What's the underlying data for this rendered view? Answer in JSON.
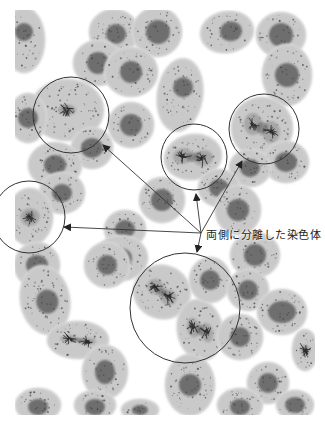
{
  "figure": {
    "width": 325,
    "height": 425,
    "background": "#ffffff",
    "image_area": {
      "x": 15,
      "y": 10,
      "width": 300,
      "height": 405
    },
    "colors": {
      "cytoplasm": "#c9c9c9",
      "cytoplasm_edge": "#d9d9d9",
      "nucleus": "#6e6e6e",
      "chromosome": "#2a2a2a",
      "speckle": "#4a4a4a",
      "annotation": "#333333"
    }
  },
  "annotation": {
    "label": "両側に分離した染色体",
    "label_position": {
      "x": 206,
      "y": 226
    },
    "arrow_origin": {
      "x": 201,
      "y": 233
    },
    "arrows": [
      {
        "to_x": 103,
        "to_y": 145
      },
      {
        "to_x": 196,
        "to_y": 194
      },
      {
        "to_x": 242,
        "to_y": 161
      },
      {
        "to_x": 64,
        "to_y": 227
      },
      {
        "to_x": 197,
        "to_y": 252
      }
    ],
    "circles": [
      {
        "cx": 71,
        "cy": 115,
        "r": 38
      },
      {
        "cx": 194,
        "cy": 157,
        "r": 33
      },
      {
        "cx": 264,
        "cy": 129,
        "r": 35
      },
      {
        "cx": 29,
        "cy": 217,
        "r": 36
      },
      {
        "cx": 185,
        "cy": 308,
        "r": 55
      }
    ]
  },
  "cells": [
    {
      "cx": 24,
      "cy": 40,
      "rx": 20,
      "ry": 32,
      "rot": 0,
      "nuc": {
        "dx": 0,
        "dy": -8,
        "rx": 9,
        "ry": 9
      },
      "phase": "interphase"
    },
    {
      "cx": 114,
      "cy": 32,
      "rx": 24,
      "ry": 22,
      "rot": 0,
      "nuc": {
        "dx": 2,
        "dy": 2,
        "rx": 10,
        "ry": 10
      },
      "phase": "interphase"
    },
    {
      "cx": 157,
      "cy": 32,
      "rx": 24,
      "ry": 24,
      "rot": 0,
      "nuc": {
        "dx": 1,
        "dy": 0,
        "rx": 12,
        "ry": 12
      },
      "phase": "interphase"
    },
    {
      "cx": 227,
      "cy": 32,
      "rx": 26,
      "ry": 20,
      "rot": -10,
      "nuc": {
        "dx": 4,
        "dy": 0,
        "rx": 11,
        "ry": 10
      },
      "phase": "interphase"
    },
    {
      "cx": 281,
      "cy": 35,
      "rx": 24,
      "ry": 22,
      "rot": 0,
      "nuc": {
        "dx": 0,
        "dy": 0,
        "rx": 12,
        "ry": 12
      },
      "phase": "interphase"
    },
    {
      "cx": 98,
      "cy": 63,
      "rx": 24,
      "ry": 22,
      "rot": 0,
      "nuc": {
        "dx": 0,
        "dy": 0,
        "rx": 11,
        "ry": 11
      },
      "phase": "interphase"
    },
    {
      "cx": 131,
      "cy": 72,
      "rx": 26,
      "ry": 24,
      "rot": 0,
      "nuc": {
        "dx": 0,
        "dy": 0,
        "rx": 11,
        "ry": 11
      },
      "phase": "interphase"
    },
    {
      "cx": 180,
      "cy": 95,
      "rx": 22,
      "ry": 36,
      "rot": 8,
      "nuc": {
        "dx": 2,
        "dy": -8,
        "rx": 10,
        "ry": 10
      },
      "phase": "interphase"
    },
    {
      "cx": 287,
      "cy": 75,
      "rx": 24,
      "ry": 30,
      "rot": 0,
      "nuc": {
        "dx": 0,
        "dy": 0,
        "rx": 12,
        "ry": 12
      },
      "phase": "interphase"
    },
    {
      "cx": 67,
      "cy": 110,
      "rx": 36,
      "ry": 30,
      "rot": 0,
      "nuc": {
        "dx": -2,
        "dy": 3,
        "rx": 13,
        "ry": 10
      },
      "phase": "metaphase"
    },
    {
      "cx": 28,
      "cy": 118,
      "rx": 18,
      "ry": 24,
      "rot": 0,
      "nuc": {
        "dx": 0,
        "dy": 0,
        "rx": 10,
        "ry": 10
      },
      "phase": "interphase"
    },
    {
      "cx": 131,
      "cy": 125,
      "rx": 22,
      "ry": 22,
      "rot": 0,
      "nuc": {
        "dx": 0,
        "dy": 0,
        "rx": 11,
        "ry": 11
      },
      "phase": "interphase"
    },
    {
      "cx": 92,
      "cy": 148,
      "rx": 20,
      "ry": 20,
      "rot": 0,
      "nuc": {
        "dx": 0,
        "dy": 0,
        "rx": 11,
        "ry": 10
      },
      "phase": "interphase"
    },
    {
      "cx": 193,
      "cy": 157,
      "rx": 28,
      "ry": 22,
      "rot": -10,
      "nuc": {
        "dx": 0,
        "dy": 0,
        "rx": 22,
        "ry": 14
      },
      "phase": "anaphase"
    },
    {
      "cx": 262,
      "cy": 128,
      "rx": 30,
      "ry": 30,
      "rot": 0,
      "nuc": {
        "dx": 0,
        "dy": 0,
        "rx": 20,
        "ry": 20
      },
      "phase": "anaphase"
    },
    {
      "cx": 286,
      "cy": 162,
      "rx": 22,
      "ry": 20,
      "rot": 0,
      "nuc": {
        "dx": 0,
        "dy": 0,
        "rx": 11,
        "ry": 10
      },
      "phase": "interphase"
    },
    {
      "cx": 250,
      "cy": 168,
      "rx": 20,
      "ry": 18,
      "rot": 0,
      "nuc": {
        "dx": 0,
        "dy": 0,
        "rx": 10,
        "ry": 9
      },
      "phase": "interphase"
    },
    {
      "cx": 55,
      "cy": 165,
      "rx": 26,
      "ry": 22,
      "rot": 0,
      "nuc": {
        "dx": 0,
        "dy": 0,
        "rx": 11,
        "ry": 10
      },
      "phase": "interphase"
    },
    {
      "cx": 62,
      "cy": 193,
      "rx": 22,
      "ry": 20,
      "rot": 0,
      "nuc": {
        "dx": 0,
        "dy": 0,
        "rx": 10,
        "ry": 9
      },
      "phase": "interphase"
    },
    {
      "cx": 162,
      "cy": 200,
      "rx": 22,
      "ry": 22,
      "rot": 0,
      "nuc": {
        "dx": 0,
        "dy": 0,
        "rx": 11,
        "ry": 11
      },
      "phase": "interphase"
    },
    {
      "cx": 219,
      "cy": 188,
      "rx": 20,
      "ry": 18,
      "rot": 0,
      "nuc": {
        "dx": 0,
        "dy": 0,
        "rx": 10,
        "ry": 9
      },
      "phase": "interphase"
    },
    {
      "cx": 238,
      "cy": 210,
      "rx": 22,
      "ry": 24,
      "rot": 0,
      "nuc": {
        "dx": 0,
        "dy": 0,
        "rx": 11,
        "ry": 11
      },
      "phase": "interphase"
    },
    {
      "cx": 30,
      "cy": 217,
      "rx": 22,
      "ry": 28,
      "rot": 0,
      "nuc": {
        "dx": 0,
        "dy": 0,
        "rx": 14,
        "ry": 16
      },
      "phase": "metaphase"
    },
    {
      "cx": 125,
      "cy": 229,
      "rx": 20,
      "ry": 18,
      "rot": 0,
      "nuc": {
        "dx": 0,
        "dy": 0,
        "rx": 10,
        "ry": 9
      },
      "phase": "interphase"
    },
    {
      "cx": 121,
      "cy": 258,
      "rx": 26,
      "ry": 22,
      "rot": 0,
      "nuc": {
        "dx": 0,
        "dy": 0,
        "rx": 11,
        "ry": 10
      },
      "phase": "interphase"
    },
    {
      "cx": 255,
      "cy": 255,
      "rx": 24,
      "ry": 22,
      "rot": 0,
      "nuc": {
        "dx": 0,
        "dy": 0,
        "rx": 11,
        "ry": 11
      },
      "phase": "interphase"
    },
    {
      "cx": 37,
      "cy": 265,
      "rx": 22,
      "ry": 22,
      "rot": 0,
      "nuc": {
        "dx": 0,
        "dy": 0,
        "rx": 11,
        "ry": 10
      },
      "phase": "interphase"
    },
    {
      "cx": 107,
      "cy": 265,
      "rx": 22,
      "ry": 22,
      "rot": 0,
      "nuc": {
        "dx": 0,
        "dy": 0,
        "rx": 10,
        "ry": 10
      },
      "phase": "interphase"
    },
    {
      "cx": 45,
      "cy": 300,
      "rx": 24,
      "ry": 34,
      "rot": -10,
      "nuc": {
        "dx": 2,
        "dy": 2,
        "rx": 11,
        "ry": 12
      },
      "phase": "interphase"
    },
    {
      "cx": 162,
      "cy": 292,
      "rx": 28,
      "ry": 26,
      "rot": 20,
      "nuc": {
        "dx": 0,
        "dy": 0,
        "rx": 18,
        "ry": 14
      },
      "phase": "anaphase"
    },
    {
      "cx": 200,
      "cy": 330,
      "rx": 22,
      "ry": 30,
      "rot": -10,
      "nuc": {
        "dx": 0,
        "dy": 0,
        "rx": 14,
        "ry": 18
      },
      "phase": "anaphase"
    },
    {
      "cx": 210,
      "cy": 280,
      "rx": 20,
      "ry": 22,
      "rot": 0,
      "nuc": {
        "dx": 0,
        "dy": 0,
        "rx": 10,
        "ry": 10
      },
      "phase": "interphase"
    },
    {
      "cx": 248,
      "cy": 290,
      "rx": 20,
      "ry": 20,
      "rot": 0,
      "nuc": {
        "dx": 0,
        "dy": 0,
        "rx": 10,
        "ry": 10
      },
      "phase": "interphase"
    },
    {
      "cx": 282,
      "cy": 312,
      "rx": 24,
      "ry": 22,
      "rot": 0,
      "nuc": {
        "dx": 0,
        "dy": 0,
        "rx": 14,
        "ry": 11
      },
      "phase": "interphase"
    },
    {
      "cx": 78,
      "cy": 340,
      "rx": 30,
      "ry": 18,
      "rot": 0,
      "nuc": {
        "dx": 0,
        "dy": 0,
        "rx": 20,
        "ry": 7
      },
      "phase": "telophase"
    },
    {
      "cx": 240,
      "cy": 337,
      "rx": 22,
      "ry": 22,
      "rot": 0,
      "nuc": {
        "dx": 0,
        "dy": 0,
        "rx": 10,
        "ry": 10
      },
      "phase": "interphase"
    },
    {
      "cx": 305,
      "cy": 350,
      "rx": 12,
      "ry": 20,
      "rot": 0,
      "nuc": {
        "dx": 0,
        "dy": 0,
        "rx": 7,
        "ry": 10
      },
      "phase": "metaphase"
    },
    {
      "cx": 105,
      "cy": 372,
      "rx": 22,
      "ry": 26,
      "rot": 0,
      "nuc": {
        "dx": 0,
        "dy": 0,
        "rx": 10,
        "ry": 12
      },
      "phase": "interphase"
    },
    {
      "cx": 190,
      "cy": 385,
      "rx": 24,
      "ry": 30,
      "rot": 0,
      "nuc": {
        "dx": 0,
        "dy": 0,
        "rx": 11,
        "ry": 11
      },
      "phase": "interphase"
    },
    {
      "cx": 268,
      "cy": 383,
      "rx": 20,
      "ry": 20,
      "rot": 0,
      "nuc": {
        "dx": 0,
        "dy": 0,
        "rx": 10,
        "ry": 10
      },
      "phase": "interphase"
    },
    {
      "cx": 295,
      "cy": 405,
      "rx": 18,
      "ry": 14,
      "rot": 0,
      "nuc": {
        "dx": 0,
        "dy": 0,
        "rx": 10,
        "ry": 8
      },
      "phase": "interphase"
    },
    {
      "cx": 38,
      "cy": 405,
      "rx": 22,
      "ry": 16,
      "rot": 0,
      "nuc": {
        "dx": 0,
        "dy": 2,
        "rx": 10,
        "ry": 8
      },
      "phase": "interphase"
    },
    {
      "cx": 95,
      "cy": 405,
      "rx": 20,
      "ry": 14,
      "rot": 0,
      "nuc": {
        "dx": 0,
        "dy": 2,
        "rx": 10,
        "ry": 8
      },
      "phase": "interphase"
    },
    {
      "cx": 140,
      "cy": 410,
      "rx": 18,
      "ry": 10,
      "rot": 0,
      "nuc": {
        "dx": 0,
        "dy": 0,
        "rx": 8,
        "ry": 5
      },
      "phase": "interphase"
    },
    {
      "cx": 240,
      "cy": 405,
      "rx": 22,
      "ry": 16,
      "rot": 0,
      "nuc": {
        "dx": 0,
        "dy": 2,
        "rx": 10,
        "ry": 8
      },
      "phase": "interphase"
    }
  ]
}
